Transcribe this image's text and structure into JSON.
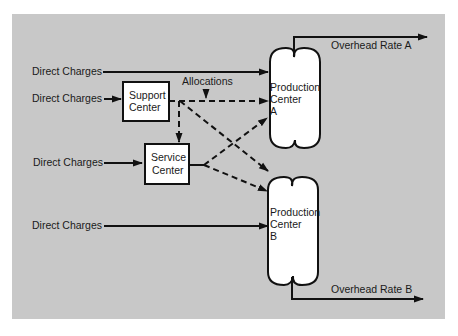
{
  "diagram": {
    "colors": {
      "background": "#c8c8c8",
      "page": "#ffffff",
      "box_fill": "#ffffff",
      "stroke": "#111111",
      "text": "#1a1a1a"
    },
    "inputs": [
      {
        "id": "dc1",
        "label": "Direct Charges",
        "target": "Production Center A",
        "style": "solid"
      },
      {
        "id": "dc2",
        "label": "Direct Charges",
        "target": "Support Center",
        "style": "solid"
      },
      {
        "id": "dc3",
        "label": "Direct Charges",
        "target": "Service Center",
        "style": "solid"
      },
      {
        "id": "dc4",
        "label": "Direct Charges",
        "target": "Production Center B",
        "style": "solid"
      }
    ],
    "nodes": {
      "support": {
        "line1": "Support",
        "line2": "Center"
      },
      "service": {
        "line1": "Service",
        "line2": "Center"
      },
      "prodA": {
        "line1": "Production",
        "line2": "Center",
        "line3": "A"
      },
      "prodB": {
        "line1": "Production",
        "line2": "Center",
        "line3": "B"
      }
    },
    "allocations_label": "Allocations",
    "allocation_flows": [
      {
        "from": "Support Center",
        "to": "Production Center A",
        "style": "dashed"
      },
      {
        "from": "Support Center",
        "to": "Service Center",
        "style": "dashed"
      },
      {
        "from": "Support Center",
        "to": "Production Center B",
        "style": "dashed"
      },
      {
        "from": "Service Center",
        "to": "Production Center A",
        "style": "dashed"
      },
      {
        "from": "Service Center",
        "to": "Production Center B",
        "style": "dashed"
      }
    ],
    "outputs": [
      {
        "from": "Production Center A",
        "label": "Overhead Rate A"
      },
      {
        "from": "Production Center B",
        "label": "Overhead Rate B"
      }
    ]
  }
}
